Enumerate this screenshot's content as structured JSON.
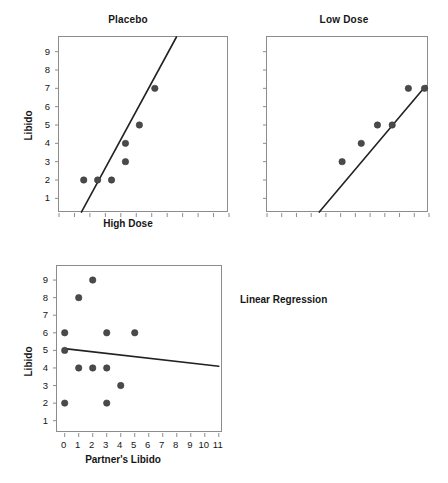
{
  "figure": {
    "width": 448,
    "height": 483,
    "background": "#ffffff",
    "point_color": "#4a4a4a",
    "line_color": "#222222",
    "axis_color": "#8c8c8c",
    "annotation": "Linear Regression"
  },
  "chart_data": [
    {
      "type": "scatter",
      "title": "Placebo",
      "xlabel": "High Dose",
      "ylabel": "Libido",
      "xlim": [
        0,
        11
      ],
      "ylim": [
        0.2,
        9.8
      ],
      "grid": false,
      "legend": "none",
      "xticks": [
        0,
        1,
        2,
        3,
        4,
        5,
        6,
        7,
        8,
        9,
        10,
        11
      ],
      "xticklabels": [
        "",
        "",
        "",
        "",
        "",
        "",
        "",
        "",
        "",
        "",
        "",
        ""
      ],
      "yticks": [
        1,
        2,
        3,
        4,
        5,
        6,
        7,
        8,
        9
      ],
      "yticklabels": [
        "1",
        "2",
        "3",
        "4",
        "5",
        "6",
        "7",
        "8",
        "9"
      ],
      "points": [
        {
          "x": 1.6,
          "y": 2
        },
        {
          "x": 2.5,
          "y": 2
        },
        {
          "x": 3.4,
          "y": 2
        },
        {
          "x": 4.3,
          "y": 3
        },
        {
          "x": 4.3,
          "y": 4
        },
        {
          "x": 5.2,
          "y": 5
        },
        {
          "x": 6.2,
          "y": 7
        }
      ],
      "fit_line": {
        "x0": 1.45,
        "y0": 0.25,
        "x1": 7.6,
        "y1": 9.8
      }
    },
    {
      "type": "scatter",
      "title": "Low Dose",
      "xlabel": "",
      "ylabel": "",
      "xlim": [
        0,
        11
      ],
      "ylim": [
        0.2,
        9.8
      ],
      "grid": false,
      "legend": "none",
      "xticks": [
        0,
        1,
        2,
        3,
        4,
        5,
        6,
        7,
        8,
        9,
        10,
        11
      ],
      "xticklabels": [
        "",
        "",
        "",
        "",
        "",
        "",
        "",
        "",
        "",
        "",
        "",
        ""
      ],
      "yticks": [
        1,
        2,
        3,
        4,
        5,
        6,
        7,
        8,
        9
      ],
      "yticklabels": [
        "",
        "",
        "",
        "",
        "",
        "",
        "",
        "",
        ""
      ],
      "points": [
        {
          "x": 5.1,
          "y": 3
        },
        {
          "x": 6.4,
          "y": 4
        },
        {
          "x": 7.5,
          "y": 5
        },
        {
          "x": 8.5,
          "y": 5
        },
        {
          "x": 9.6,
          "y": 7
        },
        {
          "x": 10.7,
          "y": 7
        }
      ],
      "fit_line": {
        "x0": 3.55,
        "y0": 0.25,
        "x1": 10.8,
        "y1": 7.15
      }
    },
    {
      "type": "scatter",
      "title": "",
      "xlabel": "Partner's Libido",
      "ylabel": "Libido",
      "xlim": [
        -0.55,
        11.3
      ],
      "ylim": [
        0.3,
        9.8
      ],
      "grid": false,
      "legend": "none",
      "xticks": [
        0,
        1,
        2,
        3,
        4,
        5,
        6,
        7,
        8,
        9,
        10,
        11
      ],
      "xticklabels": [
        "0",
        "1",
        "2",
        "3",
        "4",
        "5",
        "6",
        "7",
        "8",
        "9",
        "10",
        "11"
      ],
      "yticks": [
        1,
        2,
        3,
        4,
        5,
        6,
        7,
        8,
        9
      ],
      "yticklabels": [
        "1",
        "2",
        "3",
        "4",
        "5",
        "6",
        "7",
        "8",
        "9"
      ],
      "points": [
        {
          "x": 0,
          "y": 2
        },
        {
          "x": 0,
          "y": 5
        },
        {
          "x": 0,
          "y": 6
        },
        {
          "x": 1,
          "y": 4
        },
        {
          "x": 1,
          "y": 8
        },
        {
          "x": 2,
          "y": 4
        },
        {
          "x": 2,
          "y": 9
        },
        {
          "x": 3,
          "y": 2
        },
        {
          "x": 3,
          "y": 4
        },
        {
          "x": 3,
          "y": 6
        },
        {
          "x": 4,
          "y": 3
        },
        {
          "x": 5,
          "y": 6
        }
      ],
      "fit_line": {
        "x0": 0,
        "y0": 5.1,
        "x1": 11,
        "y1": 4.1
      }
    }
  ]
}
